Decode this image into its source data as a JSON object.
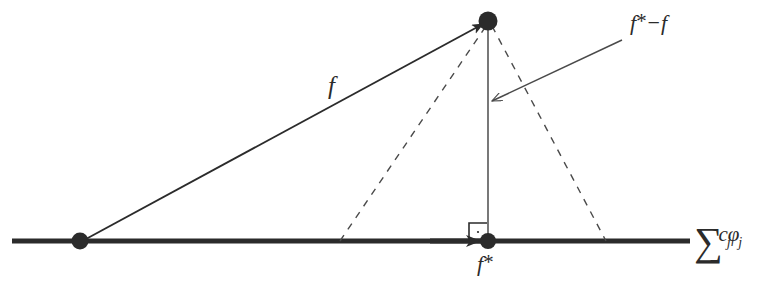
{
  "figure": {
    "background_color": "#ffffff",
    "ink_color": "#2b2b2b",
    "line_color": "#4a4a4a",
    "labels": {
      "f": "f",
      "residual_prefix": "f",
      "residual_star": "*",
      "residual_minus": "−",
      "residual_suffix": "f",
      "f_star_prefix": "f",
      "f_star_star": "*",
      "axis_sum": "∑",
      "axis_c": "c",
      "axis_c_sub": "j",
      "axis_phi": "φ",
      "axis_phi_sub": "j"
    },
    "label_names": {
      "f": "vector-f-label",
      "residual": "residual-f-star-minus-f-label",
      "f_star": "projection-f-star-label",
      "axis": "subspace-axis-label"
    },
    "geometry": {
      "axis_y": 241,
      "axis_x_start": 12,
      "axis_x_end": 690,
      "origin_point": [
        80,
        241
      ],
      "apex_point": [
        488,
        21
      ],
      "foot_point": [
        488,
        241
      ],
      "dashed_left_foot": [
        340,
        241
      ],
      "dashed_right_foot": [
        606,
        241
      ],
      "leader_start": [
        622,
        40
      ],
      "leader_end": [
        490,
        101
      ],
      "dot_radius": 9,
      "right_angle_size": 18
    }
  }
}
